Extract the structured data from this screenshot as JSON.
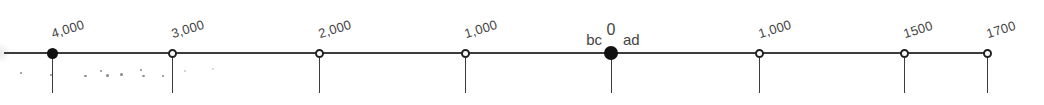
{
  "timeline": {
    "description": "Chronological timeline from 4,000 bc to 1700 ad",
    "line_color": "#3c3c3c",
    "markers": [
      {
        "label": "4,000",
        "x": 52,
        "style": "filled",
        "era": "bc"
      },
      {
        "label": "3,000",
        "x": 172,
        "style": "open",
        "era": "bc"
      },
      {
        "label": "2,000",
        "x": 319,
        "style": "open",
        "era": "bc"
      },
      {
        "label": "1,000",
        "x": 465,
        "style": "open",
        "era": "bc"
      },
      {
        "label": "0",
        "x": 611,
        "style": "filled-large",
        "era": "origin"
      },
      {
        "label": "1,000",
        "x": 759,
        "style": "open",
        "era": "ad"
      },
      {
        "label": "1500",
        "x": 904,
        "style": "open",
        "era": "ad"
      },
      {
        "label": "1700",
        "x": 987,
        "style": "open",
        "era": "ad"
      }
    ],
    "origin": {
      "label": "0",
      "bc_label": "bc",
      "ad_label": "ad"
    }
  }
}
